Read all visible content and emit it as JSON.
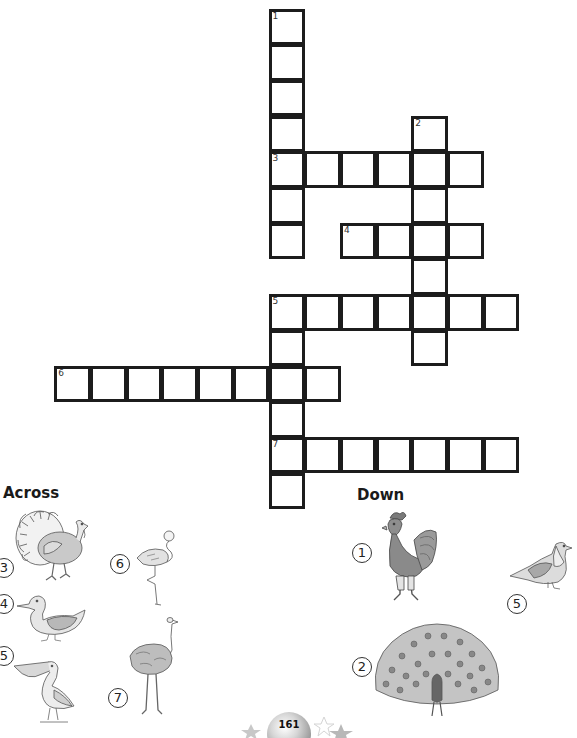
{
  "puzzle": {
    "cell_size": 35.7,
    "origin": {
      "x": 270,
      "y": 10
    },
    "words": [
      {
        "number": "1",
        "direction": "down",
        "row": 0,
        "col": 0,
        "length": 7
      },
      {
        "number": "2",
        "direction": "down",
        "row": 3,
        "col": 4,
        "length": 7
      },
      {
        "number": "3",
        "direction": "across",
        "row": 4,
        "col": 0,
        "length": 6
      },
      {
        "number": "4",
        "direction": "across",
        "row": 6,
        "col": 2,
        "length": 4
      },
      {
        "number": "5",
        "direction": "across",
        "row": 8,
        "col": 0,
        "length": 7
      },
      {
        "number": "5",
        "direction": "down",
        "row": 8,
        "col": 0,
        "length": 6
      },
      {
        "number": "6",
        "direction": "across",
        "row": 10,
        "col": -6,
        "length": 8
      },
      {
        "number": "7",
        "direction": "across",
        "row": 12,
        "col": 0,
        "length": 7
      }
    ]
  },
  "clues": {
    "across": {
      "heading": "Across",
      "items": [
        {
          "number": "3",
          "picture": "turkey"
        },
        {
          "number": "4",
          "picture": "duck"
        },
        {
          "number": "5",
          "picture": "pelican"
        },
        {
          "number": "6",
          "picture": "flamingo"
        },
        {
          "number": "7",
          "picture": "ostrich"
        }
      ]
    },
    "down": {
      "heading": "Down",
      "items": [
        {
          "number": "1",
          "picture": "rooster"
        },
        {
          "number": "2",
          "picture": "peacock"
        },
        {
          "number": "5",
          "picture": "pigeon"
        }
      ]
    }
  },
  "footer": {
    "page_number": "161"
  },
  "colors": {
    "grid_line": "#1c1c1c",
    "illustration_gray": "#9a9a9a"
  }
}
